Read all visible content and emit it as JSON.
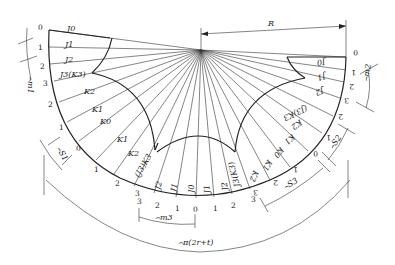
{
  "diagram": {
    "center": {
      "x": 201,
      "y": 50
    },
    "radius_label": "R",
    "outer_arc_label": "⌢π(2r+t)",
    "left_sector": {
      "station_numbers": [
        "0",
        "1",
        "2",
        "3",
        "2",
        "1",
        "0",
        "1",
        "2",
        "3"
      ],
      "labels": [
        "J0",
        "J1",
        "J2",
        "J3(K3)",
        "K2",
        "K1",
        "K0",
        "K1",
        "K2",
        "(J3)K3"
      ],
      "dim_m": "⌢m1",
      "dim_s": "⌢S1"
    },
    "middle_sector": {
      "station_numbers": [
        "3",
        "2",
        "1",
        "0",
        "1",
        "2",
        "3"
      ],
      "labels": [
        "J2",
        "J1",
        "J0",
        "J1",
        "J2",
        "J3(K3)"
      ],
      "dim_m": "⌢m3"
    },
    "right_sector": {
      "station_numbers": [
        "0",
        "1",
        "2",
        "3",
        "2",
        "1",
        "0",
        "1",
        "2",
        "3"
      ],
      "labels": [
        "J0",
        "J1",
        "J2",
        "(J3)K3",
        "K2",
        "K1",
        "K0",
        "K1",
        "K2"
      ],
      "dim_m": "⌢m2",
      "dim_s2": "⌢S2",
      "dim_s3": "⌢S3"
    }
  }
}
